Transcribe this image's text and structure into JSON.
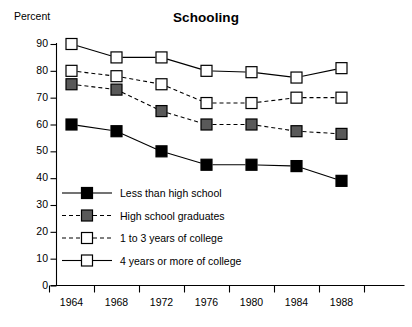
{
  "chart_data": {
    "type": "line",
    "title": "Schooling",
    "xlabel": "",
    "ylabel": "Percent",
    "ylim": [
      0,
      90
    ],
    "xlim": [
      1964,
      1988
    ],
    "grid": false,
    "legend_position": "inside-lower-left",
    "categories": [
      "1964",
      "1968",
      "1972",
      "1976",
      "1980",
      "1984",
      "1988"
    ],
    "yticks": [
      "0",
      "10",
      "20",
      "30",
      "40",
      "50",
      "60",
      "70",
      "80",
      "90"
    ],
    "series": [
      {
        "name": "Less than high school",
        "marker": "filled-square-black",
        "line": "solid",
        "color": "#000000",
        "values": [
          60,
          57.5,
          50,
          45,
          45,
          44.5,
          39
        ]
      },
      {
        "name": "High school graduates",
        "marker": "filled-square-gray",
        "line": "dashed",
        "color": "#595959",
        "values": [
          75,
          73,
          65,
          60,
          60,
          57.5,
          56.5
        ]
      },
      {
        "name": "1 to 3 years of college",
        "marker": "open-square",
        "line": "dashed",
        "color": "#ffffff",
        "values": [
          80,
          78,
          75,
          68,
          68,
          70,
          70
        ]
      },
      {
        "name": "4 years or more of college",
        "marker": "open-square",
        "line": "solid",
        "color": "#ffffff",
        "values": [
          90,
          85,
          85,
          80,
          79.5,
          77.5,
          81
        ]
      }
    ]
  },
  "legend": {
    "items": [
      {
        "label": "Less than high school"
      },
      {
        "label": "High school graduates"
      },
      {
        "label": "1 to 3 years of college"
      },
      {
        "label": "4 years or more of college"
      }
    ]
  },
  "axis": {
    "percent_label": "Percent"
  }
}
